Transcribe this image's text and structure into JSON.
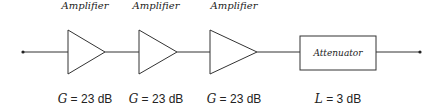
{
  "components": [
    {
      "type": "amplifier",
      "label": "Amplifier",
      "symbol": "G",
      "value": "= 23 dB"
    },
    {
      "type": "amplifier",
      "label": "Amplifier",
      "symbol": "G",
      "value": "= 23 dB"
    },
    {
      "type": "amplifier",
      "label": "Amplifier",
      "symbol": "G",
      "value": "= 23 dB"
    },
    {
      "type": "attenuator",
      "label": "Attenuator",
      "symbol": "L",
      "value": "= 3 dB"
    }
  ]
}
